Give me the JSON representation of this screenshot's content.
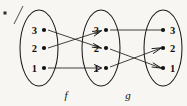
{
  "figure": {
    "background_color": "#f7f6f3",
    "ink_color": "#101010"
  },
  "sets": [
    {
      "id": "domain",
      "name": "left-set",
      "cx": 39,
      "cy": 48,
      "rx": 19,
      "ry": 38,
      "elements": [
        {
          "label": "3",
          "x": 44,
          "y": 30,
          "label_side": "left"
        },
        {
          "label": "2",
          "x": 44,
          "y": 48,
          "label_side": "left"
        },
        {
          "label": "1",
          "x": 44,
          "y": 68,
          "label_side": "left"
        }
      ]
    },
    {
      "id": "middle",
      "name": "middle-set",
      "cx": 101,
      "cy": 48,
      "rx": 19,
      "ry": 38,
      "elements": [
        {
          "label": "3",
          "x": 106,
          "y": 30,
          "label_side": "left"
        },
        {
          "label": "2",
          "x": 106,
          "y": 48,
          "label_side": "left"
        },
        {
          "label": "1",
          "x": 106,
          "y": 68,
          "label_side": "left"
        }
      ]
    },
    {
      "id": "codomain",
      "name": "right-set",
      "cx": 163,
      "cy": 48,
      "rx": 19,
      "ry": 38,
      "elements": [
        {
          "label": "3",
          "x": 157,
          "y": 30,
          "label_side": "right"
        },
        {
          "label": "2",
          "x": 157,
          "y": 48,
          "label_side": "right"
        },
        {
          "label": "1",
          "x": 157,
          "y": 68,
          "label_side": "right"
        }
      ]
    }
  ],
  "mappings": [
    {
      "name": "f",
      "label": "f",
      "label_x": 66,
      "label_y": 99,
      "from_set": "domain",
      "to_set": "middle",
      "edges": [
        {
          "from": "3",
          "to": "2",
          "x1": 48,
          "y1": 30,
          "x2": 101,
          "y2": 48
        },
        {
          "from": "2",
          "to": "3",
          "x1": 48,
          "y1": 48,
          "x2": 101,
          "y2": 31
        },
        {
          "from": "1",
          "to": "1",
          "x1": 48,
          "y1": 68,
          "x2": 101,
          "y2": 68
        }
      ]
    },
    {
      "name": "g",
      "label": "g",
      "label_x": 128,
      "label_y": 99,
      "from_set": "middle",
      "to_set": "codomain",
      "edges": [
        {
          "from": "3",
          "to": "3",
          "x1": 110,
          "y1": 30,
          "x2": 161,
          "y2": 30
        },
        {
          "from": "2",
          "to": "1",
          "x1": 110,
          "y1": 49,
          "x2": 161,
          "y2": 68
        },
        {
          "from": "1",
          "to": "2",
          "x1": 110,
          "y1": 67,
          "x2": 161,
          "y2": 48
        }
      ]
    }
  ],
  "artifact": {
    "name": "scan-corner-mark",
    "dot_x": 5,
    "dot_y": 13,
    "stroke_path": "M 14 24 L 23 6"
  }
}
